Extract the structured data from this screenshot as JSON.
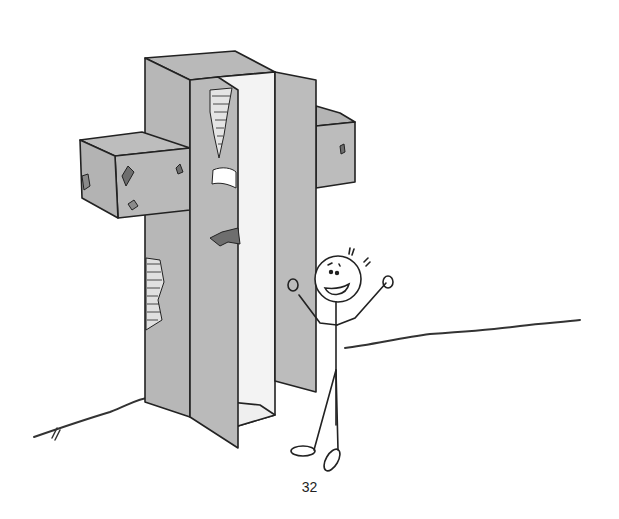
{
  "page": {
    "number": "32"
  },
  "illustration": {
    "subject": "stone-cross-with-open-door-and-stick-figure",
    "colors": {
      "stone": "#b9b9b9",
      "stone_shadow": "#a9a9a9",
      "inner_wall": "#f2f2f2",
      "ink": "#222222",
      "background": "#ffffff",
      "damage": "#6e6e6e"
    }
  }
}
